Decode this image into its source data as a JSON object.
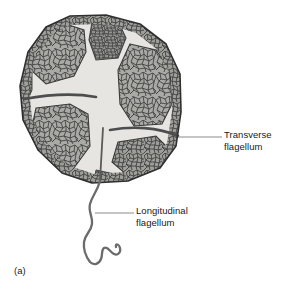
{
  "figure": {
    "panel_letter": "(a)",
    "background_color": "#ffffff"
  },
  "annotations": [
    {
      "id": "transverse",
      "line1": "Transverse",
      "line2": "flagellum",
      "leader_from": [
        178,
        137
      ],
      "leader_to": [
        222,
        137
      ]
    },
    {
      "id": "longitudinal",
      "line1": "Longitudinal",
      "line2": "flagellum",
      "leader_from": [
        95,
        213
      ],
      "leader_to": [
        134,
        213
      ]
    }
  ],
  "colors": {
    "outline": "#3a3a3a",
    "suture_light": "#e4e3df",
    "plate_fill": "#a9a9a5",
    "plate_fill_dark": "#9a9a96",
    "reticulum_line": "#3c3c3c",
    "groove_dark": "#575757",
    "flagellum": "#6b6b6b",
    "leader_line": "#8a8a8a",
    "text": "#1a1a1a"
  },
  "structures": {
    "theca_plates": 9,
    "cingulum_label": "transverse groove",
    "sulcus_label": "longitudinal groove",
    "flagella": [
      "transverse flagellum",
      "longitudinal flagellum"
    ]
  }
}
